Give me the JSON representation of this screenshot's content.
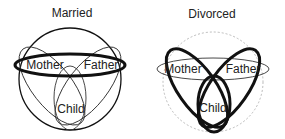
{
  "panels": [
    {
      "id": "married",
      "title": "Married",
      "labels": {
        "mother": "Mother",
        "father": "Father",
        "child": "Child"
      },
      "emphasis": "parental-dyad (thick horizontal ellipse enclosing Mother and Father)",
      "family_boundary": "solid circle"
    },
    {
      "id": "divorced",
      "title": "Divorced",
      "labels": {
        "mother": "Mother",
        "father": "Father",
        "child": "Child"
      },
      "emphasis": "parent-child loops (thick Mother-Child and Father-Child ellipses)",
      "family_boundary": "dashed gray circle"
    }
  ],
  "colors": {
    "stroke": "#111111",
    "text": "#222222",
    "dashed_boundary": "#bbbbbb",
    "background": "#ffffff"
  }
}
